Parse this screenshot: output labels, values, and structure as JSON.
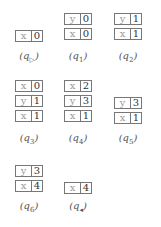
{
  "states": [
    {
      "id": "q_start",
      "label": "q",
      "sub": "▷",
      "cells": [
        {
          "k": "x",
          "v": "0"
        }
      ]
    },
    {
      "id": "q1",
      "label": "q",
      "sub": "1",
      "cells": [
        {
          "k": "y",
          "v": "0"
        },
        {
          "k": "x",
          "v": "0"
        }
      ]
    },
    {
      "id": "q2",
      "label": "q",
      "sub": "2",
      "cells": [
        {
          "k": "y",
          "v": "1"
        },
        {
          "k": "x",
          "v": "1"
        }
      ]
    },
    {
      "id": "q3",
      "label": "q",
      "sub": "3",
      "cells": [
        {
          "k": "x",
          "v": "0"
        },
        {
          "k": "y",
          "v": "1"
        },
        {
          "k": "x",
          "v": "1"
        }
      ]
    },
    {
      "id": "q4",
      "label": "q",
      "sub": "4",
      "cells": [
        {
          "k": "x",
          "v": "2"
        },
        {
          "k": "y",
          "v": "3"
        },
        {
          "k": "x",
          "v": "1"
        }
      ]
    },
    {
      "id": "q5",
      "label": "q",
      "sub": "5",
      "cells": [
        {
          "k": "y",
          "v": "3"
        },
        {
          "k": "x",
          "v": "1"
        }
      ]
    },
    {
      "id": "q6",
      "label": "q",
      "sub": "6",
      "cells": [
        {
          "k": "y",
          "v": "3"
        },
        {
          "k": "x",
          "v": "4"
        }
      ]
    },
    {
      "id": "q_end",
      "label": "q",
      "sub": "◂",
      "cells": [
        {
          "k": "x",
          "v": "4"
        }
      ]
    }
  ]
}
